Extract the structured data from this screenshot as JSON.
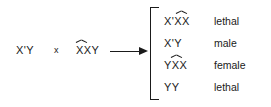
{
  "diagram": {
    "background_color": "#ffffff",
    "ink_color": "#1a1a1a",
    "cross_symbol": "x",
    "arrow_symbol": "arrow-right",
    "parents": [
      {
        "genotype": "X'Y",
        "attached_x": false
      },
      {
        "genotype": "XXY",
        "attached_x": true
      }
    ],
    "offspring": [
      {
        "genotype": "X'XX",
        "phenotype": "lethal",
        "attached_x": true
      },
      {
        "genotype": "X'Y",
        "phenotype": "male",
        "attached_x": false
      },
      {
        "genotype": "YXX",
        "phenotype": "female",
        "attached_x": true
      },
      {
        "genotype": "YY",
        "phenotype": "lethal",
        "attached_x": false
      }
    ]
  }
}
